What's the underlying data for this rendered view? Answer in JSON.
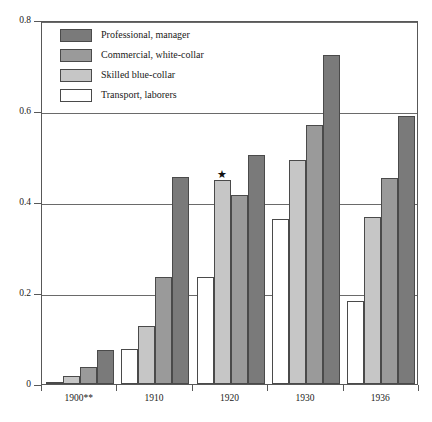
{
  "chart_data": {
    "type": "bar",
    "title": "",
    "subtitle": "",
    "xlabel": "",
    "ylabel": "",
    "categories": [
      "1900**",
      "1910",
      "1920",
      "1930",
      "1936"
    ],
    "ylim": [
      0,
      0.8
    ],
    "yticks": [
      0,
      0.2,
      0.4,
      0.6,
      0.8
    ],
    "ytick_labels": [
      "0",
      "0.2",
      "0.4",
      "0.6",
      "0.8"
    ],
    "grid": true,
    "gridlines_at": [
      0.2,
      0.4,
      0.6,
      0.8
    ],
    "legend_position": "top-left",
    "bar_order_left_to_right": [
      "Transport, laborers",
      "Skilled blue-collar",
      "Commercial, white-collar",
      "Professional, manager"
    ],
    "series": [
      {
        "name": "Professional, manager",
        "color": "#7a7a7a",
        "values": [
          0.075,
          0.455,
          0.503,
          0.723,
          0.588
        ]
      },
      {
        "name": "Commercial, white-collar",
        "color": "#9a9a9a",
        "values": [
          0.037,
          0.235,
          0.415,
          0.57,
          0.452
        ]
      },
      {
        "name": "Skilled blue-collar",
        "color": "#c6c6c6",
        "values": [
          0.018,
          0.128,
          0.448,
          0.492,
          0.368
        ]
      },
      {
        "name": "Transport, laborers",
        "color": "#ffffff",
        "values": [
          0.004,
          0.078,
          0.235,
          0.362,
          0.182
        ]
      }
    ],
    "annotations": [
      {
        "text": "★",
        "symbol_name": "star-marker",
        "category": "1920",
        "series": "Skilled blue-collar",
        "value": 0.448
      }
    ]
  },
  "legend": {
    "entries": [
      {
        "label": "Professional, manager",
        "color": "#7a7a7a"
      },
      {
        "label": "Commercial, white-collar",
        "color": "#9a9a9a"
      },
      {
        "label": "Skilled blue-collar",
        "color": "#c6c6c6"
      },
      {
        "label": "Transport, laborers",
        "color": "#ffffff"
      }
    ]
  },
  "axes": {
    "y_labels": [
      "0.8",
      "0.6",
      "0.4",
      "0.2",
      "0"
    ],
    "x_labels": [
      "1900**",
      "1910",
      "1920",
      "1930",
      "1936"
    ]
  }
}
